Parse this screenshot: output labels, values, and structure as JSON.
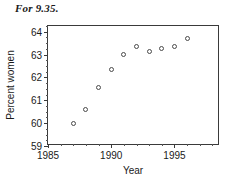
{
  "caption": "For 9.35.",
  "chart_data": {
    "type": "scatter",
    "title": "",
    "xlabel": "Year",
    "ylabel": "Percent women",
    "xlim": [
      1985,
      1998.6
    ],
    "ylim": [
      59,
      64.25
    ],
    "grid": false,
    "legend": "none",
    "marker": "open-circle",
    "x_major_ticks": [
      1985,
      1990,
      1995
    ],
    "x_major_tick_labels": [
      "1985",
      "1990",
      "1995"
    ],
    "x_minor_tick_step": 1,
    "y_major_ticks": [
      59,
      60,
      61,
      62,
      63,
      64
    ],
    "y_major_tick_labels": [
      "59",
      "60",
      "61",
      "62",
      "63",
      "64"
    ],
    "y_minor_tick_step": 0.25,
    "x": [
      1987,
      1988,
      1989,
      1990,
      1991,
      1992,
      1993,
      1994,
      1995,
      1996
    ],
    "values": [
      60.0,
      60.6,
      61.55,
      62.35,
      63.0,
      63.35,
      63.15,
      63.25,
      63.35,
      63.7
    ],
    "series": [
      {
        "name": "Percent women",
        "points": [
          {
            "x": 1987,
            "y": 60.0
          },
          {
            "x": 1988,
            "y": 60.6
          },
          {
            "x": 1989,
            "y": 61.55
          },
          {
            "x": 1990,
            "y": 62.35
          },
          {
            "x": 1991,
            "y": 63.0
          },
          {
            "x": 1992,
            "y": 63.35
          },
          {
            "x": 1993,
            "y": 63.15
          },
          {
            "x": 1994,
            "y": 63.25
          },
          {
            "x": 1995,
            "y": 63.35
          },
          {
            "x": 1996,
            "y": 63.7
          }
        ]
      }
    ],
    "colors": {
      "marker_edge": "#4a4a4a",
      "axis": "#3a3a3a",
      "text": "#1a1a1a",
      "background": "#ffffff"
    }
  }
}
